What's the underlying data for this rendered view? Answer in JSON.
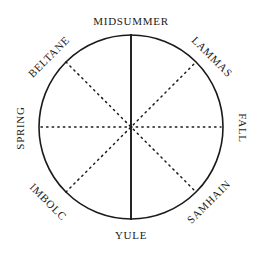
{
  "diagram": {
    "background_color": "#ffffff",
    "stroke_color": "#1a1a1a",
    "circle": {
      "center_x": 131,
      "center_y": 127,
      "radius": 92,
      "stroke_width": 1.6
    },
    "solid_axis": {
      "name": "midsummer-yule-axis",
      "orientation": "vertical",
      "style": "solid",
      "stroke_width": 1.8
    },
    "dotted_axes": [
      {
        "name": "spring-fall-axis",
        "orientation": "horizontal",
        "style": "dotted",
        "angle_deg": 0
      },
      {
        "name": "beltane-samhain-axis",
        "orientation": "diagonal",
        "style": "dotted",
        "angle_deg": 45
      },
      {
        "name": "imbolc-lammas-axis",
        "orientation": "diagonal",
        "style": "dotted",
        "angle_deg": 135
      }
    ],
    "labels": [
      {
        "id": "midsummer",
        "text": "MIDSUMMER",
        "position": "top",
        "angle_deg": 0,
        "rotation_deg": 0
      },
      {
        "id": "lammas",
        "text": "LAMMAS",
        "position": "upper-right",
        "angle_deg": 45,
        "rotation_deg": 45
      },
      {
        "id": "fall",
        "text": "FALL",
        "position": "right",
        "angle_deg": 90,
        "rotation_deg": 90
      },
      {
        "id": "samhain",
        "text": "SAMHAIN",
        "position": "lower-right",
        "angle_deg": 135,
        "rotation_deg": -45
      },
      {
        "id": "yule",
        "text": "YULE",
        "position": "bottom",
        "angle_deg": 180,
        "rotation_deg": 0
      },
      {
        "id": "imbolc",
        "text": "IMBOLC",
        "position": "lower-left",
        "angle_deg": 225,
        "rotation_deg": 45
      },
      {
        "id": "spring",
        "text": "SPRING",
        "position": "left",
        "angle_deg": 270,
        "rotation_deg": -90
      },
      {
        "id": "beltane",
        "text": "BELTANE",
        "position": "upper-left",
        "angle_deg": 315,
        "rotation_deg": -45
      }
    ]
  }
}
